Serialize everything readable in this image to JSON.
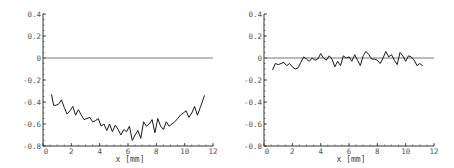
{
  "chart_data": [
    {
      "type": "line",
      "title": "",
      "xlabel": "x [mm]",
      "ylabel": "",
      "xlim": [
        0,
        12
      ],
      "ylim": [
        -0.8,
        0.4
      ],
      "xticks": [
        0,
        2,
        4,
        6,
        8,
        10,
        12
      ],
      "xtick_labels": [
        "0",
        "2",
        "4",
        "6",
        "8",
        "10",
        "12"
      ],
      "yticks": [
        0.4,
        0.2,
        0,
        -0.2,
        -0.4,
        -0.6,
        -0.8
      ],
      "ytick_labels": [
        "0.4",
        "0.2",
        "0",
        "-0.2",
        "-0.4",
        "-0.6",
        "-0.8"
      ],
      "grid": false,
      "reference_line": 0,
      "series": [
        {
          "name": "profile",
          "x": [
            0.6,
            0.75,
            0.9,
            1.1,
            1.3,
            1.5,
            1.7,
            1.9,
            2.1,
            2.3,
            2.5,
            2.7,
            2.9,
            3.1,
            3.3,
            3.5,
            3.7,
            3.9,
            4.1,
            4.3,
            4.5,
            4.7,
            4.9,
            5.1,
            5.3,
            5.5,
            5.7,
            5.9,
            6.1,
            6.3,
            6.5,
            6.7,
            6.9,
            7.1,
            7.3,
            7.5,
            7.7,
            7.9,
            8.1,
            8.3,
            8.5,
            8.7,
            8.9,
            9.1,
            9.3,
            9.5,
            9.7,
            9.9,
            10.1,
            10.3,
            10.5,
            10.7,
            10.9,
            11.1,
            11.4
          ],
          "y": [
            -0.33,
            -0.43,
            -0.43,
            -0.42,
            -0.38,
            -0.45,
            -0.51,
            -0.48,
            -0.44,
            -0.52,
            -0.47,
            -0.52,
            -0.56,
            -0.55,
            -0.54,
            -0.58,
            -0.57,
            -0.55,
            -0.62,
            -0.6,
            -0.66,
            -0.6,
            -0.67,
            -0.61,
            -0.65,
            -0.7,
            -0.65,
            -0.67,
            -0.62,
            -0.75,
            -0.7,
            -0.66,
            -0.73,
            -0.58,
            -0.62,
            -0.6,
            -0.56,
            -0.68,
            -0.55,
            -0.62,
            -0.65,
            -0.58,
            -0.62,
            -0.6,
            -0.58,
            -0.55,
            -0.52,
            -0.5,
            -0.48,
            -0.54,
            -0.5,
            -0.44,
            -0.52,
            -0.45,
            -0.34
          ]
        }
      ]
    },
    {
      "type": "line",
      "title": "",
      "xlabel": "x [mm]",
      "ylabel": "",
      "xlim": [
        0,
        12
      ],
      "ylim": [
        -0.8,
        0.4
      ],
      "xticks": [
        0,
        2,
        4,
        6,
        8,
        10,
        12
      ],
      "xtick_labels": [
        "0",
        "2",
        "4",
        "6",
        "8",
        "10",
        "12"
      ],
      "yticks": [
        0.4,
        0.2,
        0,
        -0.2,
        -0.4,
        -0.6,
        -0.8
      ],
      "ytick_labels": [
        "0.4",
        "0.2",
        "0",
        "-0.2",
        "-0.4",
        "-0.6",
        "-0.8"
      ],
      "grid": false,
      "reference_line": 0,
      "series": [
        {
          "name": "profile",
          "x": [
            0.6,
            0.8,
            1.0,
            1.2,
            1.4,
            1.6,
            1.8,
            2.0,
            2.2,
            2.4,
            2.6,
            2.8,
            3.0,
            3.2,
            3.4,
            3.6,
            3.8,
            4.0,
            4.2,
            4.4,
            4.6,
            4.8,
            5.0,
            5.2,
            5.4,
            5.6,
            5.8,
            6.0,
            6.2,
            6.4,
            6.6,
            6.8,
            7.0,
            7.2,
            7.4,
            7.6,
            7.8,
            8.0,
            8.2,
            8.4,
            8.6,
            8.8,
            9.0,
            9.2,
            9.4,
            9.6,
            9.8,
            10.0,
            10.2,
            10.4,
            10.6,
            10.8,
            11.0,
            11.2
          ],
          "y": [
            -0.11,
            -0.05,
            -0.06,
            -0.05,
            -0.04,
            -0.07,
            -0.05,
            -0.08,
            -0.1,
            -0.09,
            -0.04,
            0.01,
            -0.01,
            -0.03,
            0.0,
            -0.02,
            -0.01,
            0.04,
            0.0,
            -0.02,
            0.02,
            -0.01,
            -0.08,
            -0.03,
            -0.07,
            0.02,
            0.0,
            0.01,
            -0.03,
            0.03,
            -0.02,
            -0.07,
            0.02,
            0.06,
            0.03,
            -0.01,
            -0.01,
            -0.02,
            -0.05,
            0.0,
            0.06,
            0.01,
            0.03,
            -0.02,
            -0.06,
            0.05,
            0.02,
            -0.03,
            0.02,
            0.01,
            -0.02,
            -0.07,
            -0.05,
            -0.07
          ]
        }
      ]
    }
  ]
}
